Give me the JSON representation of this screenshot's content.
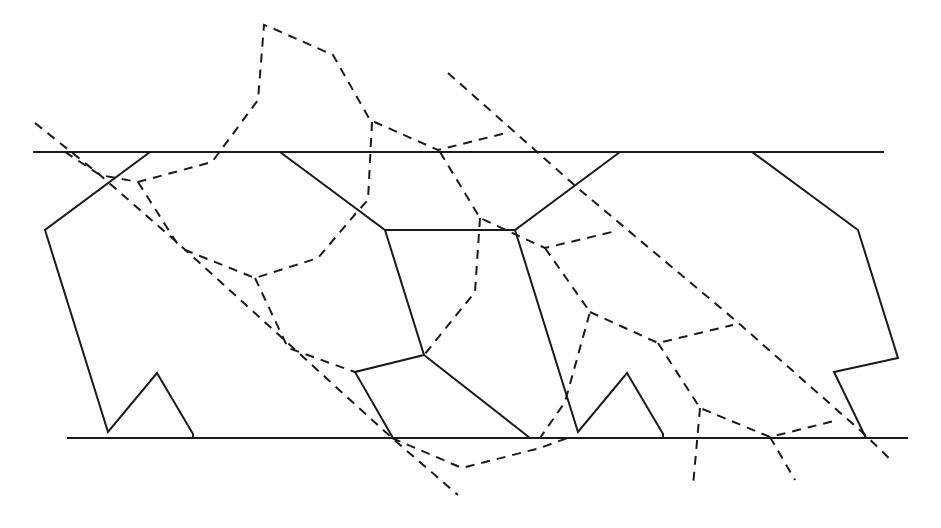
{
  "diagram": {
    "colors": {
      "background": "#ffffff",
      "stroke": "#1a1a1a"
    },
    "solid_lines": [
      {
        "name": "top-boundary-line",
        "points": [
          [
            33,
            152
          ],
          [
            884,
            152
          ]
        ]
      },
      {
        "name": "bottom-boundary-line",
        "points": [
          [
            67,
            438
          ],
          [
            908,
            438
          ]
        ]
      },
      {
        "name": "left-cell-outline",
        "points": [
          [
            150,
            152
          ],
          [
            45,
            230
          ],
          [
            108,
            432
          ],
          [
            157,
            373
          ],
          [
            193,
            434
          ],
          [
            193,
            438
          ]
        ]
      },
      {
        "name": "center-top-cell-outline",
        "points": [
          [
            280,
            152
          ],
          [
            385,
            230
          ],
          [
            515,
            230
          ],
          [
            620,
            152
          ]
        ]
      },
      {
        "name": "center-left-edge",
        "points": [
          [
            385,
            230
          ],
          [
            424,
            355
          ],
          [
            355,
            372
          ],
          [
            393,
            438
          ]
        ]
      },
      {
        "name": "center-diagonal-edge",
        "points": [
          [
            424,
            355
          ],
          [
            530,
            438
          ]
        ]
      },
      {
        "name": "center-right-cell-outline",
        "points": [
          [
            515,
            230
          ],
          [
            578,
            432
          ],
          [
            627,
            373
          ],
          [
            663,
            434
          ],
          [
            663,
            438
          ]
        ]
      },
      {
        "name": "right-cell-outline",
        "points": [
          [
            752,
            152
          ],
          [
            858,
            230
          ],
          [
            898,
            358
          ],
          [
            834,
            372
          ],
          [
            866,
            438
          ]
        ]
      }
    ],
    "dashed_lines": [
      {
        "name": "long-diagonal-left",
        "points": [
          [
            35,
            123
          ],
          [
            100,
            175
          ],
          [
            180,
            245
          ],
          [
            290,
            345
          ],
          [
            392,
            438
          ],
          [
            458,
            495
          ]
        ]
      },
      {
        "name": "long-diagonal-right",
        "points": [
          [
            448,
            73
          ],
          [
            580,
            190
          ],
          [
            735,
            320
          ],
          [
            862,
            432
          ],
          [
            893,
            462
          ]
        ]
      },
      {
        "name": "upper-branch-left",
        "points": [
          [
            65,
            152
          ],
          [
            100,
            175
          ],
          [
            138,
            182
          ],
          [
            212,
            162
          ],
          [
            258,
            100
          ],
          [
            264,
            25
          ],
          [
            272,
            28
          ],
          [
            333,
            55
          ],
          [
            370,
            120
          ],
          [
            438,
            150
          ],
          [
            510,
            132
          ]
        ]
      },
      {
        "name": "upper-branch-vertical",
        "points": [
          [
            372,
            122
          ],
          [
            368,
            200
          ],
          [
            357,
            212
          ],
          [
            318,
            258
          ],
          [
            255,
            278
          ],
          [
            180,
            248
          ]
        ]
      },
      {
        "name": "inner-branch-1",
        "points": [
          [
            138,
            182
          ],
          [
            180,
            248
          ]
        ]
      },
      {
        "name": "inner-branch-2",
        "points": [
          [
            255,
            278
          ],
          [
            288,
            348
          ],
          [
            355,
            372
          ]
        ]
      },
      {
        "name": "center-dashed-1",
        "points": [
          [
            440,
            152
          ],
          [
            480,
            218
          ],
          [
            545,
            248
          ],
          [
            612,
            232
          ]
        ]
      },
      {
        "name": "center-dashed-2",
        "points": [
          [
            480,
            218
          ],
          [
            475,
            292
          ],
          [
            424,
            355
          ]
        ]
      },
      {
        "name": "center-dashed-3",
        "points": [
          [
            545,
            248
          ],
          [
            590,
            312
          ],
          [
            565,
            402
          ],
          [
            540,
            438
          ]
        ]
      },
      {
        "name": "lower-left-tail",
        "points": [
          [
            392,
            438
          ],
          [
            462,
            468
          ],
          [
            540,
            448
          ],
          [
            573,
            436
          ]
        ]
      },
      {
        "name": "right-dashed-1",
        "points": [
          [
            590,
            312
          ],
          [
            658,
            343
          ],
          [
            733,
            325
          ]
        ]
      },
      {
        "name": "right-dashed-2",
        "points": [
          [
            658,
            343
          ],
          [
            700,
            408
          ],
          [
            770,
            437
          ],
          [
            838,
            420
          ]
        ]
      },
      {
        "name": "right-dashed-3",
        "points": [
          [
            700,
            408
          ],
          [
            693,
            486
          ]
        ]
      },
      {
        "name": "right-dashed-4",
        "points": [
          [
            770,
            437
          ],
          [
            795,
            480
          ]
        ]
      }
    ]
  }
}
